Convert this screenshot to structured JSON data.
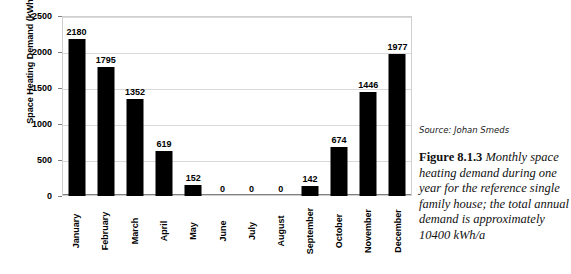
{
  "chart_data": {
    "type": "bar",
    "title": "",
    "xlabel": "",
    "ylabel": "Space Heating Demand (kWh)",
    "ylim": [
      0,
      2500
    ],
    "yticks": [
      0,
      500,
      1000,
      1500,
      2000,
      2500
    ],
    "ytick_labels": [
      "0",
      "500",
      "1000",
      "1500",
      "2000",
      "2500"
    ],
    "grid": true,
    "legend": "none",
    "bar_color": "#000000",
    "categories": [
      "January",
      "February",
      "March",
      "April",
      "May",
      "June",
      "July",
      "August",
      "September",
      "October",
      "November",
      "December"
    ],
    "values": [
      2180,
      1795,
      1352,
      619,
      152,
      0,
      0,
      0,
      142,
      674,
      1446,
      1977
    ],
    "value_labels": [
      "2180",
      "1795",
      "1352",
      "619",
      "152",
      "0",
      "0",
      "0",
      "142",
      "674",
      "1446",
      "1977"
    ]
  },
  "caption": {
    "source": "Source: Johan Smeds",
    "figure_number": "Figure 8.1.3",
    "figure_text": " Monthly space heating demand during one year for the reference single family house; the total annual demand is approximately 10400 kWh/a"
  }
}
